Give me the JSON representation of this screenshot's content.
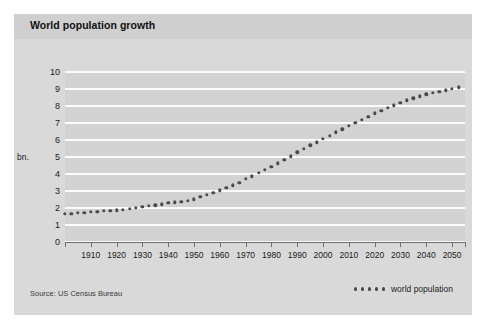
{
  "card": {
    "title": "World population growth",
    "source_note": "Source: US Census Bureau"
  },
  "legend": {
    "label": "world population",
    "marker_count": 5,
    "marker_color": "#4a4a4a"
  },
  "colors": {
    "page_background": "#ffffff",
    "card_background": "#d9d9d9",
    "title_band": "#cfcfcf",
    "plot_background": "#d2d2d2",
    "gridline": "#fbfbfb",
    "axis": "#6f6f6f",
    "marker": "#4a4a4a",
    "text": "#1a1a1a"
  },
  "chart_data": {
    "type": "scatter",
    "title": "World population growth",
    "subtitle": "",
    "xlabel": "",
    "ylabel": "bn.",
    "ylabel_position_value": 5,
    "xlim": [
      1900,
      2055
    ],
    "ylim": [
      0,
      10
    ],
    "grid": true,
    "grid_axis": "y",
    "legend_position": "bottom-right",
    "source": "Source: US Census Bureau",
    "y_ticks": [
      0,
      1,
      2,
      3,
      4,
      5,
      6,
      7,
      8,
      9,
      10
    ],
    "y_tick_labels": [
      "0",
      "1",
      "2",
      "3",
      "4",
      "5",
      "6",
      "7",
      "8",
      "9",
      "10"
    ],
    "x_ticks": [
      1910,
      1920,
      1930,
      1940,
      1950,
      1960,
      1970,
      1980,
      1990,
      2000,
      2010,
      2020,
      2030,
      2040,
      2050
    ],
    "x_tick_labels": [
      "1910",
      "1920",
      "1930",
      "1940",
      "1950",
      "1960",
      "1970",
      "1980",
      "1990",
      "2000",
      "2010",
      "2020",
      "2030",
      "2040",
      "2050"
    ],
    "series": [
      {
        "name": "world population",
        "marker": "dot",
        "x": [
          1900,
          1902.5,
          1905,
          1907.5,
          1910,
          1912.5,
          1915,
          1917.5,
          1920,
          1922.5,
          1925,
          1927.5,
          1930,
          1932.5,
          1935,
          1937.5,
          1940,
          1942.5,
          1945,
          1947.5,
          1950,
          1952.5,
          1955,
          1957.5,
          1960,
          1962.5,
          1965,
          1967.5,
          1970,
          1972.5,
          1975,
          1977.5,
          1980,
          1982.5,
          1985,
          1987.5,
          1990,
          1992.5,
          1995,
          1997.5,
          2000,
          2002.5,
          2005,
          2007.5,
          2010,
          2012.5,
          2015,
          2017.5,
          2020,
          2022.5,
          2025,
          2027.5,
          2030,
          2032.5,
          2035,
          2037.5,
          2040,
          2042.5,
          2045,
          2047.5,
          2050,
          2052.5
        ],
        "y": [
          1.65,
          1.67,
          1.7,
          1.73,
          1.76,
          1.79,
          1.82,
          1.84,
          1.86,
          1.9,
          1.95,
          2.0,
          2.07,
          2.12,
          2.17,
          2.22,
          2.3,
          2.33,
          2.36,
          2.42,
          2.52,
          2.65,
          2.77,
          2.9,
          3.04,
          3.18,
          3.33,
          3.48,
          3.7,
          3.86,
          4.07,
          4.23,
          4.44,
          4.62,
          4.85,
          5.05,
          5.27,
          5.48,
          5.69,
          5.87,
          6.08,
          6.25,
          6.45,
          6.62,
          6.85,
          7.02,
          7.2,
          7.38,
          7.58,
          7.72,
          7.9,
          8.05,
          8.2,
          8.33,
          8.45,
          8.56,
          8.68,
          8.76,
          8.85,
          8.93,
          9.02,
          9.1
        ]
      }
    ]
  }
}
